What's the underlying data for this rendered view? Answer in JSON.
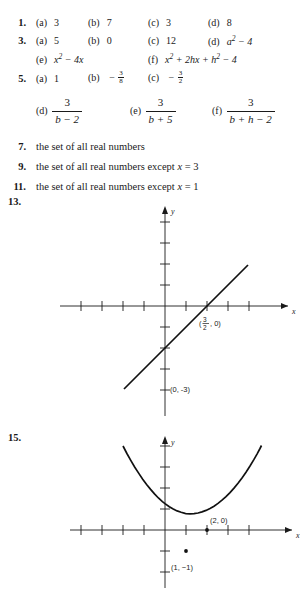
{
  "answers": [
    {
      "number": "1.",
      "parts": [
        {
          "label": "(a)",
          "value": "3"
        },
        {
          "label": "(b)",
          "value": "7"
        },
        {
          "label": "(c)",
          "value": "3"
        },
        {
          "label": "(d)",
          "value": "8"
        }
      ]
    },
    {
      "number": "3.",
      "parts": [
        {
          "label": "(a)",
          "value": "5"
        },
        {
          "label": "(b)",
          "value": "0"
        },
        {
          "label": "(c)",
          "value": "12"
        },
        {
          "label": "(d)",
          "value": "a² − 4"
        },
        {
          "label": "(e)",
          "value": "x² − 4x"
        },
        {
          "label": "(f)",
          "value": "x² + 2hx + h² − 4"
        }
      ]
    },
    {
      "number": "5.",
      "parts": [
        {
          "label": "(a)",
          "value": "1"
        },
        {
          "label": "(b)",
          "value": "− 3/8"
        },
        {
          "label": "(c)",
          "value": "− 3/2"
        },
        {
          "label": "(d)",
          "value": "3 / (b − 2)"
        },
        {
          "label": "(e)",
          "value": "3 / (b + 5)"
        },
        {
          "label": "(f)",
          "value": "3 / (b + h − 2)"
        }
      ]
    },
    {
      "number": "7.",
      "text": "the set of all real numbers"
    },
    {
      "number": "9.",
      "text": "the set of all real numbers except x = 3"
    },
    {
      "number": "11.",
      "text": "the set of all real numbers except x = 1"
    }
  ],
  "fractions": {
    "neg_three_eighths": {
      "sign": "−",
      "num": "3",
      "den": "8"
    },
    "neg_three_halves": {
      "sign": "−",
      "num": "3",
      "den": "2"
    },
    "d": {
      "num": "3",
      "den": "b − 2"
    },
    "e": {
      "num": "3",
      "den": "b + 5"
    },
    "f": {
      "num": "3",
      "den": "b + h − 2"
    }
  },
  "labels": {
    "a": "(a)",
    "b": "(b)",
    "c": "(c)",
    "d": "(d)",
    "e": "(e)",
    "f": "(f)",
    "minus": "−"
  },
  "text_answers": {
    "all_reals": "the set of all real numbers",
    "except_prefix": "the set of all real numbers except",
    "x_var": "x",
    "equals": "=",
    "three": "3",
    "one": "1"
  },
  "graphs": [
    {
      "number": "13.",
      "type": "line",
      "x_axis_label": "x",
      "y_axis_label": "y",
      "x_intercept_label": "(3/2, 0)",
      "x_intercept_num": "3",
      "x_intercept_den": "2",
      "x_intercept_rest": ", 0)",
      "x_intercept_open": "(",
      "y_intercept_label": "(0, -3)",
      "points": [
        {
          "x": 1.5,
          "y": 0
        },
        {
          "x": 0,
          "y": -3
        }
      ],
      "slope": 2,
      "intercept": -3
    },
    {
      "number": "15.",
      "type": "parabola",
      "x_axis_label": "x",
      "y_axis_label": "y",
      "vertex_label": "(1, −1)",
      "root_label": "(2, 0)",
      "vertex": {
        "x": 1,
        "y": -1
      },
      "roots": [
        0,
        2
      ],
      "equation_form": "y = x² − 2x"
    }
  ]
}
